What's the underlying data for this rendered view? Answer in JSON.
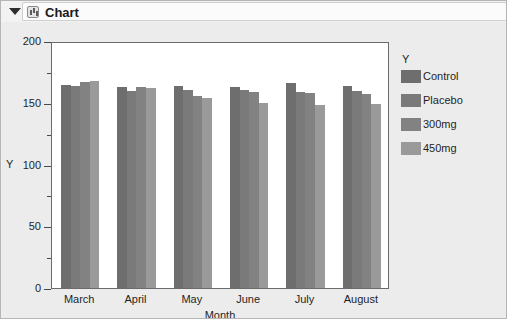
{
  "window": {
    "title": "Chart",
    "disclosure_icon": "triangle-down-icon",
    "node_icon": "chart-node-icon"
  },
  "chart_data": {
    "type": "bar",
    "title": "",
    "xlabel": "Month",
    "ylabel": "Y",
    "categories": [
      "March",
      "April",
      "May",
      "June",
      "July",
      "August"
    ],
    "series": [
      {
        "name": "Control",
        "color": "#6e6e6e",
        "values": [
          166,
          164,
          165,
          164,
          167,
          165
        ]
      },
      {
        "name": "Placebo",
        "color": "#7a7a7a",
        "values": [
          165,
          161,
          162,
          162,
          160,
          161
        ]
      },
      {
        "name": "300mg",
        "color": "#828282",
        "values": [
          168,
          164,
          157,
          160,
          159,
          158
        ]
      },
      {
        "name": "450mg",
        "color": "#9a9a9a",
        "values": [
          169,
          163,
          155,
          151,
          149,
          150
        ]
      }
    ],
    "ylim": [
      0,
      200
    ],
    "yticks": [
      0,
      50,
      100,
      150,
      200
    ],
    "ytick_labels": [
      "0",
      "50",
      "100",
      "150",
      "200"
    ],
    "yminor_ticks": [
      25,
      75,
      125,
      175
    ],
    "grid": false,
    "legend_position": "right",
    "legend_title": "Y"
  }
}
